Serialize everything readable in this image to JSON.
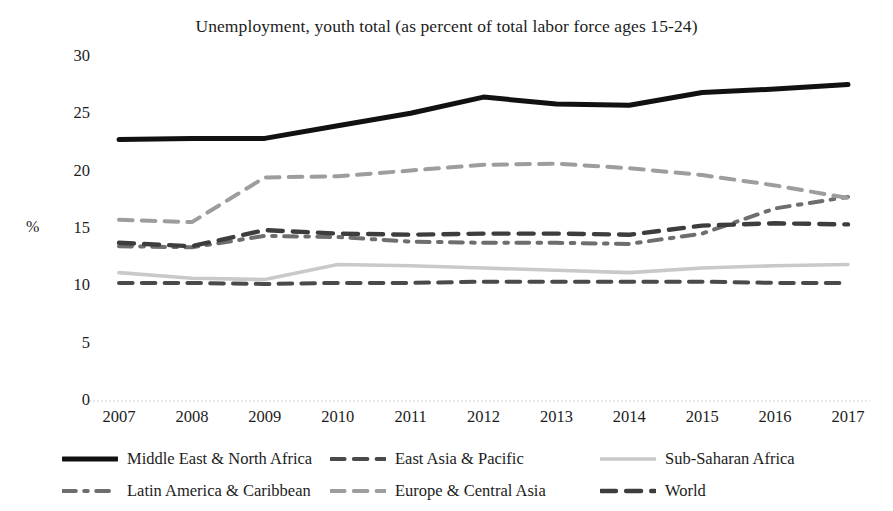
{
  "chart_data": {
    "type": "line",
    "title": "Unemployment, youth total (as percent of total labor force ages 15-24)",
    "xlabel": "",
    "ylabel": "%",
    "ylim": [
      0,
      30
    ],
    "ytick_step": 5,
    "yticks": [
      "0",
      "5",
      "10",
      "15",
      "20",
      "25",
      "30"
    ],
    "grid": false,
    "legend_position": "bottom",
    "categories": [
      "2007",
      "2008",
      "2009",
      "2010",
      "2011",
      "2012",
      "2013",
      "2014",
      "2015",
      "2016",
      "2017"
    ],
    "series": [
      {
        "name": "Middle East & North Africa",
        "color": "#111111",
        "style": "solid",
        "width": 5.0,
        "values": [
          22.8,
          22.9,
          22.9,
          24.0,
          25.1,
          26.5,
          25.9,
          25.8,
          26.9,
          27.2,
          27.6
        ]
      },
      {
        "name": "East Asia & Pacific",
        "color": "#4a4a4a",
        "style": "dashed",
        "width": 4.0,
        "values": [
          10.3,
          10.3,
          10.2,
          10.3,
          10.3,
          10.4,
          10.4,
          10.4,
          10.4,
          10.3,
          10.3
        ]
      },
      {
        "name": "Sub-Saharan Africa",
        "color": "#c9c9c9",
        "style": "solid",
        "width": 3.6,
        "values": [
          11.2,
          10.7,
          10.6,
          11.9,
          11.8,
          11.6,
          11.4,
          11.2,
          11.6,
          11.8,
          11.9
        ]
      },
      {
        "name": "Latin America & Caribbean",
        "color": "#6e6e6e",
        "style": "dashdot",
        "width": 4.0,
        "values": [
          13.5,
          13.4,
          14.4,
          14.3,
          13.9,
          13.8,
          13.8,
          13.7,
          14.6,
          16.8,
          17.8
        ]
      },
      {
        "name": "Europe & Central Asia",
        "color": "#9d9d9d",
        "style": "dashed",
        "width": 4.0,
        "values": [
          15.8,
          15.6,
          19.5,
          19.6,
          20.1,
          20.6,
          20.7,
          20.3,
          19.7,
          18.8,
          17.7
        ]
      },
      {
        "name": "World",
        "color": "#3d3d3d",
        "style": "dashed",
        "width": 4.4,
        "values": [
          13.8,
          13.5,
          14.9,
          14.6,
          14.5,
          14.6,
          14.6,
          14.5,
          15.3,
          15.5,
          15.4
        ]
      }
    ]
  },
  "legend": {
    "rows": [
      [
        {
          "label": "Middle East & North Africa",
          "series_index": 0
        },
        {
          "label": "East Asia & Pacific",
          "series_index": 1
        },
        {
          "label": "Sub-Saharan Africa",
          "series_index": 2
        }
      ],
      [
        {
          "label": "Latin America & Caribbean",
          "series_index": 3
        },
        {
          "label": "Europe & Central Asia",
          "series_index": 4
        },
        {
          "label": "World",
          "series_index": 5
        }
      ]
    ]
  }
}
